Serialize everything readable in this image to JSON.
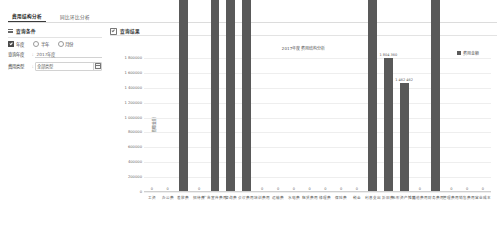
{
  "tabs": [
    {
      "label": "费用结构分析",
      "active": true
    },
    {
      "label": "同比环比分析",
      "active": false
    }
  ],
  "sidebar": {
    "title": "查询条件",
    "list_icon": "list-icon",
    "radio_group": [
      {
        "label": "年度",
        "checked": true
      },
      {
        "label": "半年",
        "checked": false
      },
      {
        "label": "月份",
        "checked": false
      }
    ],
    "fields": [
      {
        "label": "查询年度",
        "separator": ":",
        "value": "2017年度",
        "type": "text"
      },
      {
        "label": "费用类型",
        "separator": ":",
        "value": "全部类型",
        "type": "select",
        "button_icon": "calendar-icon"
      }
    ]
  },
  "chart_panel": {
    "title": "查询结果",
    "check_icon": "checkbox-checked-icon"
  },
  "chart_data": {
    "type": "bar",
    "title": "2017年度费用结构分析",
    "xlabel": "",
    "ylabel": "费用金额",
    "ylim": [
      0,
      1800000
    ],
    "grid": true,
    "legend_position": "top-right",
    "legend": [
      "费用金额"
    ],
    "yticks": [
      "1 800000",
      "1 600000",
      "1 400000",
      "1 200000",
      "1 000000",
      "800000",
      "600000",
      "400000",
      "200000",
      "0"
    ],
    "categories": [
      "工资",
      "办公费",
      "差旅费",
      "招待费",
      "广告宣传费用",
      "咨询费",
      "会议费用",
      "培训费用",
      "运输费",
      "水电费",
      "租赁费用",
      "修理费",
      "保险费",
      "税金",
      "利息支出",
      "折旧费",
      "无形资产摊销",
      "其他费用",
      "财务费用",
      "管理费用",
      "销售费用",
      "营业成本"
    ],
    "values": [
      0,
      0,
      487331168,
      0,
      54961340,
      447600780,
      716887151,
      0,
      0,
      0,
      0,
      0,
      0,
      0,
      52942880,
      1804360,
      1462462,
      0,
      1627234298,
      0,
      0,
      0
    ],
    "labels": [
      "0",
      "0",
      "487 331 168",
      "0",
      "54 961 340",
      "447 600 780",
      "716 887 151",
      "0",
      "0",
      "0",
      "0",
      "0",
      "0",
      "0",
      "52 942 880",
      "1 804 360",
      "1 462 462",
      "0",
      "1 627 234 298",
      "0",
      "0",
      "0"
    ]
  }
}
